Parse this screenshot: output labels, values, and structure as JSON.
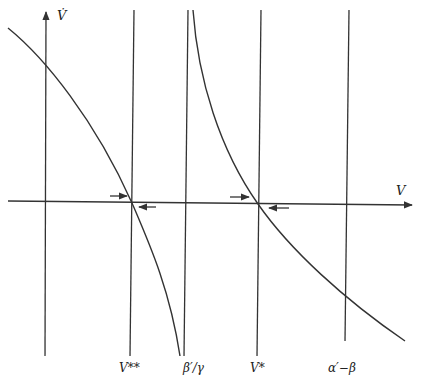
{
  "diagram": {
    "type": "phase-line plot",
    "axes": {
      "y_label": "V̇",
      "x_label": "V"
    },
    "vertical_lines": [
      {
        "id": "v-double-star",
        "label": "V**",
        "x_top": 134,
        "x_bottom": 130
      },
      {
        "id": "beta-over-gamma",
        "label": "β′/γ",
        "x_top": 188,
        "x_bottom": 184
      },
      {
        "id": "v-star",
        "label": "V*",
        "x_top": 261,
        "x_bottom": 257
      },
      {
        "id": "alpha-minus-beta",
        "label": "α′−β",
        "x_top": 349,
        "x_bottom": 345
      }
    ],
    "curves": [
      {
        "id": "left-branch",
        "description": "decreasing curve from upper-left through V** crossing to asymptote β′/γ at bottom"
      },
      {
        "id": "right-branch",
        "description": "decreasing curve from asymptote β′/γ at top through V* crossing to lower-right"
      }
    ],
    "arrows": [
      {
        "id": "arrow-left-of-vss",
        "direction": "right"
      },
      {
        "id": "arrow-right-of-vss",
        "direction": "left"
      },
      {
        "id": "arrow-left-of-vs",
        "direction": "right"
      },
      {
        "id": "arrow-right-of-vs",
        "direction": "left"
      }
    ],
    "colors": {
      "ink": "#333333",
      "background": "#ffffff"
    }
  },
  "labels": {
    "y_axis": "V̇",
    "x_axis": "V",
    "v_double_star": "V**",
    "beta_over_gamma": "β′/γ",
    "v_star": "V*",
    "alpha_minus_beta": "α′−β"
  }
}
